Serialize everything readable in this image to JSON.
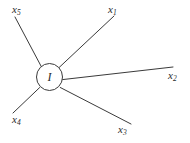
{
  "figure": {
    "type": "vertex-diagram",
    "width": 190,
    "height": 143,
    "background_color": "#ffffff",
    "stroke_color": "#3a3a3a",
    "text_color": "#2b2b2b"
  },
  "vertex": {
    "label": "I",
    "shape": "circle",
    "cx": 49.5,
    "cy": 77,
    "rx": 13,
    "ry": 13.5
  },
  "legs": [
    {
      "id": "x1",
      "base": "x",
      "subscript": "1",
      "x1": 58.8,
      "y1": 67.8,
      "x2": 114,
      "y2": 16,
      "label_left": 108,
      "label_top": 4
    },
    {
      "id": "x2",
      "base": "x",
      "subscript": "2",
      "x1": 62.4,
      "y1": 79.6,
      "x2": 173,
      "y2": 67,
      "label_left": 168,
      "label_top": 70
    },
    {
      "id": "x3",
      "base": "x",
      "subscript": "3",
      "x1": 60.3,
      "y1": 87.5,
      "x2": 131,
      "y2": 124,
      "label_left": 118,
      "label_top": 124
    },
    {
      "id": "x4",
      "base": "x",
      "subscript": "4",
      "x1": 39.6,
      "y1": 87.6,
      "x2": 13,
      "y2": 113,
      "label_left": 12,
      "label_top": 114
    },
    {
      "id": "x5",
      "base": "x",
      "subscript": "5",
      "x1": 41.2,
      "y1": 66.4,
      "x2": 15,
      "y2": 17,
      "label_left": 12,
      "label_top": 4
    }
  ]
}
